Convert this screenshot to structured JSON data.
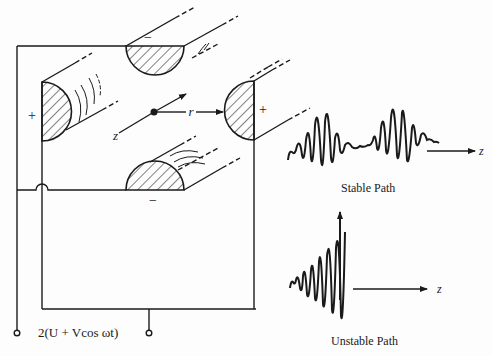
{
  "figure": {
    "colors": {
      "ink": "#1a1a1a",
      "background": "#fdfdfd"
    }
  },
  "electrodes": {
    "top": {
      "polarity": "−"
    },
    "bottom": {
      "polarity": "−"
    },
    "left": {
      "polarity": "+"
    },
    "right": {
      "polarity": "+"
    }
  },
  "axes": {
    "z_label": "z",
    "r_label": "r"
  },
  "circuit": {
    "voltage_label": "2(U + Vcos ωt)"
  },
  "stable_path": {
    "caption": "Stable Path",
    "axis_label": "z"
  },
  "unstable_path": {
    "caption": "Unstable Path",
    "axis_label": "z"
  }
}
